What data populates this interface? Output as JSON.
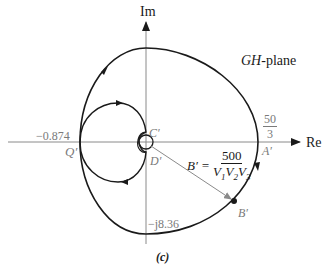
{
  "figure": {
    "caption": "(c)",
    "plane_label_italic": "GH",
    "plane_label_rest": "-plane",
    "axes": {
      "imag_label": "Im",
      "real_label": "Re"
    },
    "points": {
      "q_value": "−0.874",
      "q_label": "Q′",
      "c_label": "C′",
      "d_label": "D′",
      "a_label": "A′",
      "a_value_num": "50",
      "a_value_den": "3",
      "b_label": "B′",
      "imag_intercept": "−j8.36"
    },
    "b_equation": {
      "lhs": "B′ =",
      "numerator": "500",
      "denominator_parts": [
        "V",
        "1",
        "V",
        "2",
        "V",
        "3"
      ]
    },
    "colors": {
      "curve": "#1a1a1a",
      "axis": "#8a8a8a",
      "label_gray": "#7a7a7a"
    }
  }
}
